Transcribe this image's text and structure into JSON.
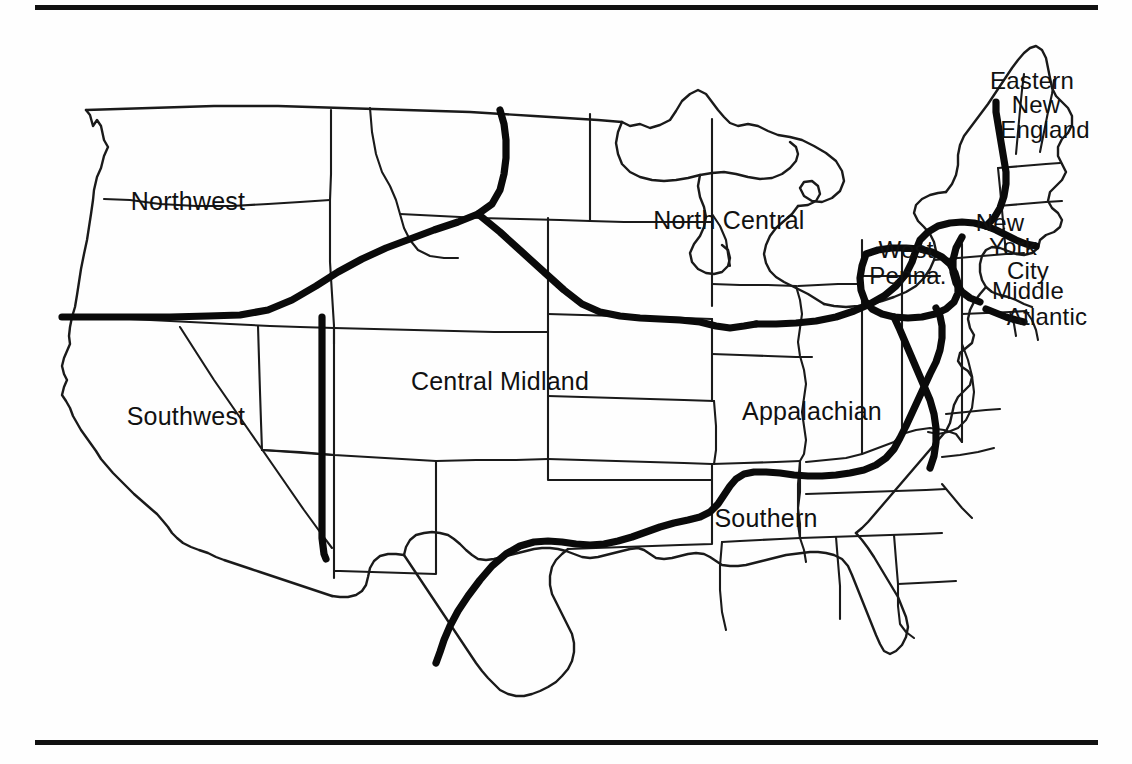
{
  "figure": {
    "kind": "map",
    "title_visible": false,
    "background_color": "#ffffff",
    "ink_color": "#111111",
    "rules": {
      "top_rule": true,
      "bottom_rule": true
    }
  },
  "map": {
    "subject": "United States dialect regions",
    "state_outlines": true,
    "dialect_boundary_style": "thick black line",
    "state_boundary_style": "thin black line",
    "labels": [
      {
        "id": "northwest",
        "text": "Northwest",
        "x": 188,
        "y": 196,
        "anchor": "middle"
      },
      {
        "id": "southwest",
        "text": "Southwest",
        "x": 186,
        "y": 411,
        "anchor": "middle"
      },
      {
        "id": "central-midland",
        "text": "Central Midland",
        "x": 500,
        "y": 376,
        "anchor": "middle"
      },
      {
        "id": "north-central",
        "text": "North Central",
        "x": 729,
        "y": 215,
        "anchor": "middle"
      },
      {
        "id": "appalachian",
        "text": "Appalachian",
        "x": 812,
        "y": 406,
        "anchor": "middle"
      },
      {
        "id": "southern",
        "text": "Southern",
        "x": 766,
        "y": 513,
        "anchor": "middle"
      },
      {
        "id": "west-penna-1",
        "text": "West",
        "x": 906,
        "y": 244,
        "anchor": "middle"
      },
      {
        "id": "west-penna-2",
        "text": "Penna.",
        "x": 908,
        "y": 270,
        "anchor": "middle"
      },
      {
        "id": "eastern-new-england-1",
        "text": "Eastern",
        "x": 1032,
        "y": 75,
        "anchor": "middle"
      },
      {
        "id": "eastern-new-england-2",
        "text": "New",
        "x": 1036,
        "y": 99,
        "anchor": "middle"
      },
      {
        "id": "eastern-new-england-3",
        "text": "England",
        "x": 1045,
        "y": 124,
        "anchor": "middle"
      },
      {
        "id": "new-york-city-1",
        "text": "New",
        "x": 1000,
        "y": 217,
        "anchor": "middle"
      },
      {
        "id": "new-york-city-2",
        "text": "York",
        "x": 1013,
        "y": 241,
        "anchor": "middle"
      },
      {
        "id": "new-york-city-3",
        "text": "City",
        "x": 1028,
        "y": 265,
        "anchor": "middle"
      },
      {
        "id": "middle-atlantic-1",
        "text": "Middle",
        "x": 1028,
        "y": 285,
        "anchor": "middle"
      },
      {
        "id": "middle-atlantic-2",
        "text": "Atlantic",
        "x": 1047,
        "y": 311,
        "anchor": "middle"
      }
    ],
    "regions": [
      "Northwest",
      "Southwest",
      "Central Midland",
      "North Central",
      "Appalachian",
      "Southern",
      "West Penna.",
      "Eastern New England",
      "New York City",
      "Middle Atlantic"
    ]
  }
}
